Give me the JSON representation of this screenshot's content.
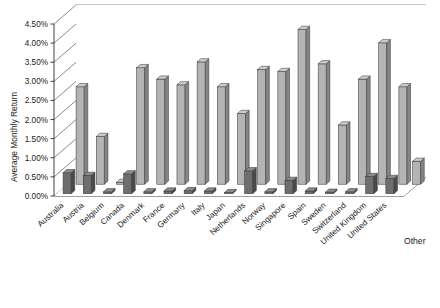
{
  "chart_data": {
    "type": "bar",
    "title": "",
    "subtitle": "",
    "xlabel": "",
    "ylabel": "Average Monthly Return",
    "ylim": [
      0,
      4.5
    ],
    "ytick_step": 0.5,
    "ytick_labels": [
      "0.00%",
      "0.50%",
      "1.00%",
      "1.50%",
      "2.00%",
      "2.50%",
      "3.00%",
      "3.50%",
      "4.00%",
      "4.50%"
    ],
    "ytick_values": [
      0,
      0.5,
      1.0,
      1.5,
      2.0,
      2.5,
      3.0,
      3.5,
      4.0,
      4.5
    ],
    "grid": true,
    "grid_axis": "y",
    "legend": false,
    "legend_position": "none",
    "three_d": true,
    "depth_axis_label": "Other",
    "categories": [
      "Australia",
      "Austria",
      "Belgium",
      "Canada",
      "Denmark",
      "France",
      "Germany",
      "Italy",
      "Japan",
      "Netherlands",
      "Norway",
      "Singapore",
      "Spain",
      "Sweden",
      "Switzerland",
      "United Kingdom",
      "United States"
    ],
    "series": [
      {
        "name": "front",
        "color": "#6e6e6e",
        "values": [
          0.55,
          0.48,
          0.05,
          0.52,
          0.05,
          0.07,
          0.08,
          0.07,
          0.03,
          0.6,
          0.05,
          0.35,
          0.07,
          0.04,
          0.05,
          0.45,
          0.4
        ]
      },
      {
        "name": "back",
        "color": "#b4b4b4",
        "values": [
          2.55,
          1.25,
          0.05,
          3.05,
          2.75,
          2.6,
          3.2,
          2.55,
          1.85,
          3.0,
          2.95,
          4.05,
          3.15,
          1.55,
          2.75,
          3.7,
          2.55
        ]
      }
    ],
    "other_bar": {
      "category": "Other",
      "value": 0.6,
      "color": "#b4b4b4"
    }
  },
  "colors": {
    "front_bar": "#6e6e6e",
    "front_bar_side": "#4a4a4a",
    "front_bar_top": "#8c8c8c",
    "back_bar": "#b4b4b4",
    "back_bar_side": "#858585",
    "back_bar_top": "#cdcdcd",
    "grid": "#5a5a5a",
    "axis": "#2b2b2b",
    "background": "#ffffff",
    "text": "#1a1a1a"
  }
}
